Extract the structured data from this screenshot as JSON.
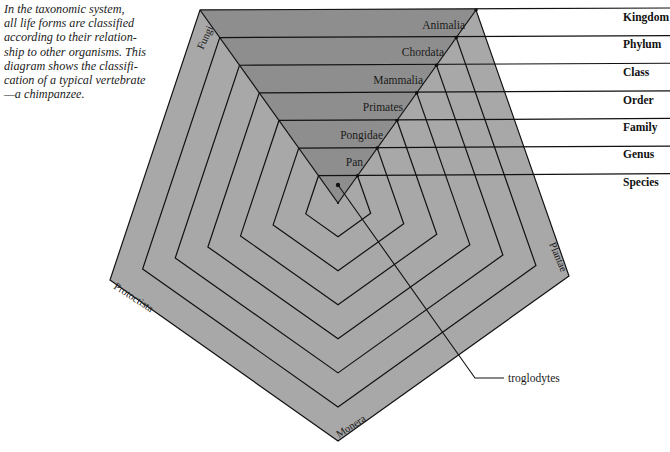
{
  "caption": {
    "lines": [
      "In the taxonomic system,",
      "all life forms are classified",
      "according to their relation-",
      "ship to other organisms. This",
      "diagram shows the classifi-",
      "cation of a typical vertebrate",
      "—a chimpanzee."
    ]
  },
  "ranks": [
    {
      "rank": "Kingdom",
      "taxon": "Animalia"
    },
    {
      "rank": "Phylum",
      "taxon": "Chordata"
    },
    {
      "rank": "Class",
      "taxon": "Mammalia"
    },
    {
      "rank": "Order",
      "taxon": "Primates"
    },
    {
      "rank": "Family",
      "taxon": "Pongidae"
    },
    {
      "rank": "Genus",
      "taxon": "Pan"
    },
    {
      "rank": "Species",
      "taxon": ""
    }
  ],
  "species_callout": "troglodytes",
  "kingdoms": {
    "top_left": "Fungi",
    "left": "Protoctista",
    "bottom": "Monera",
    "right": "Plantae",
    "top": "Animalia"
  },
  "colors": {
    "pentagon_fill": "#a8a8a8",
    "highlight_fill": "#8e8e8e",
    "line": "#111111",
    "background": "#ffffff"
  }
}
